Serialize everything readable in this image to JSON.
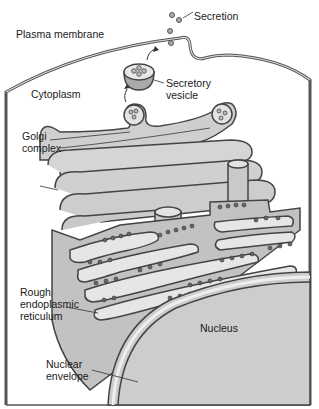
{
  "labels": {
    "plasma_membrane": "Plasma membrane",
    "secretion": "Secretion",
    "secretory_vesicle_1": "Secretory",
    "secretory_vesicle_2": "vesicle",
    "cytoplasm": "Cytoplasm",
    "golgi_1": "Golgi",
    "golgi_2": "complex",
    "rer_1": "Rough",
    "rer_2": "endoplasmic",
    "rer_3": "reticulum",
    "nucleus": "Nucleus",
    "nuclear_env_1": "Nuclear",
    "nuclear_env_2": "envelope"
  },
  "colors": {
    "membrane_fill": "#c8c8c8",
    "membrane_stroke": "#4a4a4a",
    "lumen": "#e6e6e6",
    "nucleus_fill": "#cfcfcf",
    "ribosome": "#555555",
    "background": "#ffffff"
  }
}
